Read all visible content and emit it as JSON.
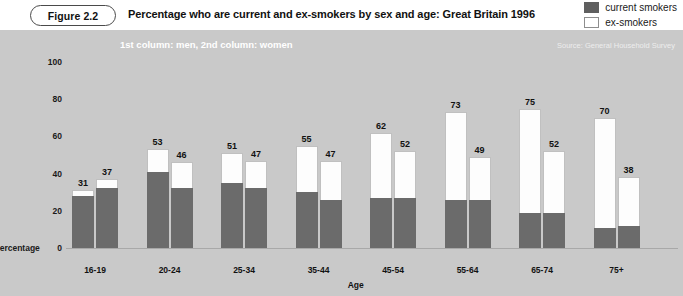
{
  "header": {
    "figure_badge": "Figure 2.2",
    "title": "Percentage who are current and ex-smokers by sex and age: Great Britain 1996",
    "legend": [
      {
        "label": "current smokers",
        "swatch": "dark-gray",
        "color": "#5f5f5f"
      },
      {
        "label": "ex-smokers",
        "swatch": "white",
        "color": "#ffffff"
      }
    ]
  },
  "panel": {
    "subtitle": "1st column: men, 2nd column: women",
    "source": "Source: General Household Survey",
    "background_color": "#c9c9c9"
  },
  "chart_data": {
    "type": "bar",
    "title": "Percentage who are current and ex-smokers by sex and age: Great Britain 1996",
    "subtitle": "1st column: men, 2nd column: women",
    "xlabel": "Age",
    "ylabel": "Percentage",
    "ylim": [
      0,
      100
    ],
    "yticks": [
      0,
      20,
      40,
      60,
      80,
      100
    ],
    "grid": false,
    "legend_position": "top-right",
    "stacked": true,
    "categories": [
      "16-19",
      "20-24",
      "25-34",
      "35-44",
      "45-54",
      "55-64",
      "65-74",
      "75+"
    ],
    "series": [
      {
        "name": "men",
        "column": 1,
        "totals": [
          31,
          53,
          51,
          55,
          62,
          73,
          75,
          70
        ],
        "current_smokers": [
          28,
          41,
          35,
          30,
          27,
          26,
          19,
          11
        ],
        "ex_smokers": [
          3,
          12,
          16,
          25,
          35,
          47,
          56,
          59
        ]
      },
      {
        "name": "women",
        "column": 2,
        "totals": [
          37,
          46,
          47,
          47,
          52,
          49,
          52,
          38
        ],
        "current_smokers": [
          32,
          32,
          32,
          26,
          27,
          26,
          19,
          12
        ],
        "ex_smokers": [
          5,
          14,
          15,
          21,
          25,
          23,
          33,
          26
        ]
      }
    ]
  }
}
